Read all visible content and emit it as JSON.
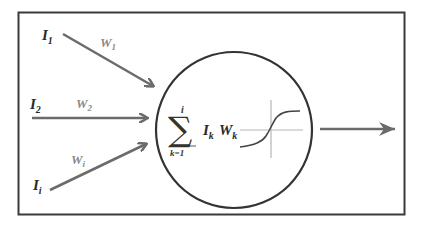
{
  "diagram": {
    "inputs": [
      {
        "label": "I",
        "sub": "1",
        "weight": "W",
        "weight_sub": "1"
      },
      {
        "label": "I",
        "sub": "2",
        "weight": "W",
        "weight_sub": "2"
      },
      {
        "label": "I",
        "sub": "i",
        "weight": "W",
        "weight_sub": "i"
      }
    ],
    "formula": {
      "sigma": "∑",
      "upper": "i",
      "lower": "k=1",
      "term1": "I",
      "term1_sub": "k",
      "term2": "W",
      "term2_sub": "k"
    },
    "activation": "sigmoid",
    "output": "output-arrow",
    "colors": {
      "frame": "#3a3a3a",
      "circle": "#333333",
      "arrow": "#6b6b6b",
      "axis": "#b5b5b5",
      "curve": "#444444",
      "weight_label": "#8a8a8a"
    }
  }
}
